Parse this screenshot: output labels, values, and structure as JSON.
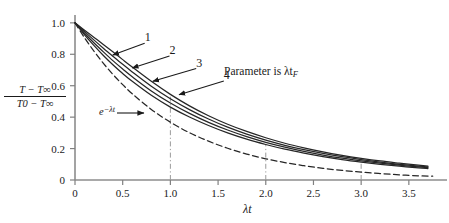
{
  "figure": {
    "background_color": "#ffffff",
    "curve_color": "#262626",
    "axis_color": "#808080",
    "guide_color": "#9a9a9a"
  },
  "chart_data": {
    "type": "line",
    "title": "",
    "xlabel": "λt",
    "ylabel_numerator": "T − T∞",
    "ylabel_denominator": "T0 − T∞",
    "xlim": [
      0,
      3.9
    ],
    "ylim": [
      0,
      1.05
    ],
    "xticks": [
      0,
      0.5,
      1.0,
      1.5,
      2.0,
      2.5,
      3.0,
      3.5
    ],
    "xticklabels": [
      "0",
      "0.5",
      "1.0",
      "1.5",
      "2.0",
      "2.5",
      "3.0",
      "3.5"
    ],
    "yticks": [
      0,
      0.2,
      0.4,
      0.6,
      0.8,
      1.0
    ],
    "yticklabels": [
      "0",
      "0.2",
      "0.4",
      "0.6",
      "0.8",
      "1.0"
    ],
    "grid": false,
    "legend": "none",
    "annotations": [
      {
        "name": "parameter-note",
        "text": "Parameter is λt",
        "subscript": "F",
        "x": 2.0,
        "y": 0.66
      },
      {
        "name": "exp-curve-label",
        "text": "e",
        "superscript": "−λt",
        "x": 0.52,
        "y": 0.425
      }
    ],
    "reference_lines": [
      {
        "name": "vline-1",
        "x": 1.0,
        "y_top": 0.53,
        "style": "dash-dot"
      },
      {
        "name": "vline-2",
        "x": 2.0,
        "y_top": 0.225,
        "style": "dash-dot"
      },
      {
        "name": "vline-3",
        "x": 3.0,
        "y_top": 0.105,
        "style": "dash-dot"
      }
    ],
    "callouts": [
      {
        "label": "1",
        "label_x": 0.72,
        "label_y": 0.895,
        "tip_x": 0.395,
        "tip_y": 0.795
      },
      {
        "label": "2",
        "label_x": 0.98,
        "label_y": 0.815,
        "tip_x": 0.6,
        "tip_y": 0.713
      },
      {
        "label": "3",
        "label_x": 1.26,
        "label_y": 0.735,
        "tip_x": 0.815,
        "tip_y": 0.628
      },
      {
        "label": "4",
        "label_x": 1.55,
        "label_y": 0.655,
        "tip_x": 1.09,
        "tip_y": 0.543
      }
    ],
    "series": [
      {
        "name": "curve-1",
        "label": "1",
        "style": "solid",
        "x": [
          0,
          0.1,
          0.2,
          0.3,
          0.4,
          0.5,
          0.6,
          0.8,
          1.0,
          1.2,
          1.4,
          1.6,
          1.8,
          2.0,
          2.2,
          2.4,
          2.6,
          2.8,
          3.0,
          3.2,
          3.4,
          3.6,
          3.7
        ],
        "y": [
          1.0,
          0.953,
          0.907,
          0.861,
          0.814,
          0.766,
          0.719,
          0.628,
          0.545,
          0.472,
          0.409,
          0.355,
          0.309,
          0.269,
          0.234,
          0.205,
          0.179,
          0.157,
          0.138,
          0.121,
          0.107,
          0.094,
          0.088
        ]
      },
      {
        "name": "curve-2",
        "label": "2",
        "style": "solid",
        "x": [
          0,
          0.1,
          0.2,
          0.3,
          0.4,
          0.5,
          0.6,
          0.8,
          1.0,
          1.2,
          1.4,
          1.6,
          1.8,
          2.0,
          2.2,
          2.4,
          2.6,
          2.8,
          3.0,
          3.2,
          3.4,
          3.6,
          3.7
        ],
        "y": [
          1.0,
          0.944,
          0.89,
          0.837,
          0.786,
          0.736,
          0.688,
          0.597,
          0.517,
          0.448,
          0.388,
          0.336,
          0.292,
          0.254,
          0.221,
          0.193,
          0.169,
          0.148,
          0.13,
          0.114,
          0.1,
          0.088,
          0.083
        ]
      },
      {
        "name": "curve-3",
        "label": "3",
        "style": "solid",
        "x": [
          0,
          0.1,
          0.2,
          0.3,
          0.4,
          0.5,
          0.6,
          0.8,
          1.0,
          1.2,
          1.4,
          1.6,
          1.8,
          2.0,
          2.2,
          2.4,
          2.6,
          2.8,
          3.0,
          3.2,
          3.4,
          3.6,
          3.7
        ],
        "y": [
          1.0,
          0.934,
          0.872,
          0.814,
          0.758,
          0.706,
          0.657,
          0.567,
          0.49,
          0.424,
          0.367,
          0.318,
          0.276,
          0.24,
          0.209,
          0.182,
          0.159,
          0.139,
          0.122,
          0.107,
          0.094,
          0.083,
          0.078
        ]
      },
      {
        "name": "curve-4",
        "label": "4",
        "style": "solid",
        "x": [
          0,
          0.1,
          0.2,
          0.3,
          0.4,
          0.5,
          0.6,
          0.8,
          1.0,
          1.2,
          1.4,
          1.6,
          1.8,
          2.0,
          2.2,
          2.4,
          2.6,
          2.8,
          3.0,
          3.2,
          3.4,
          3.6,
          3.7
        ],
        "y": [
          1.0,
          0.924,
          0.855,
          0.791,
          0.732,
          0.678,
          0.628,
          0.539,
          0.464,
          0.401,
          0.347,
          0.3,
          0.26,
          0.226,
          0.196,
          0.171,
          0.149,
          0.13,
          0.114,
          0.1,
          0.088,
          0.077,
          0.073
        ]
      },
      {
        "name": "curve-exp",
        "label": "e^(-λt)",
        "style": "dashed",
        "x": [
          0,
          0.1,
          0.2,
          0.3,
          0.4,
          0.5,
          0.6,
          0.8,
          1.0,
          1.2,
          1.4,
          1.6,
          1.8,
          2.0,
          2.2,
          2.4,
          2.6,
          2.8,
          3.0,
          3.2,
          3.4,
          3.6,
          3.75
        ],
        "y": [
          1.0,
          0.905,
          0.819,
          0.741,
          0.67,
          0.607,
          0.549,
          0.449,
          0.368,
          0.301,
          0.247,
          0.202,
          0.165,
          0.135,
          0.111,
          0.091,
          0.074,
          0.061,
          0.05,
          0.041,
          0.033,
          0.027,
          0.024
        ]
      }
    ]
  }
}
